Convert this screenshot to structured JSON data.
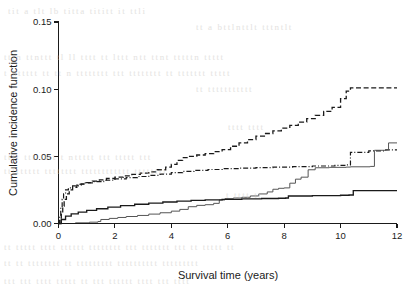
{
  "figure": {
    "background_color": "#ffffff",
    "ink_color": "#1a1a1a"
  },
  "bleed_through_text": [
    {
      "text": "tit  a  tlt lb  titta  tititt  it  ttli",
      "x": 8,
      "y": 6,
      "size": 9,
      "opacity": 0.5
    },
    {
      "text": "tt a bttlnttlt  tttntlt",
      "x": 196,
      "y": 22,
      "size": 9,
      "opacity": 0.5
    },
    {
      "text": "tttn ttnttt  tl ll tttt  tt lttt  ntt  ttnt tttttn ttttt",
      "x": 4,
      "y": 52,
      "size": 9,
      "opacity": 0.5
    },
    {
      "text": "t  nttttt  tt  tt n tttttttt   ttt  tttttttt  tt  ttttttt  ttttt",
      "x": 4,
      "y": 68,
      "size": 9,
      "opacity": 0.5
    },
    {
      "text": "tt ttttttttttt",
      "x": 196,
      "y": 84,
      "size": 9,
      "opacity": 0.5
    },
    {
      "text": "tttt tttt",
      "x": 228,
      "y": 122,
      "size": 9,
      "opacity": 0.5
    },
    {
      "text": "tttt ttt tttt   t  nttttt   ttt  ttttt  ttt",
      "x": 4,
      "y": 152,
      "size": 9,
      "opacity": 0.5
    },
    {
      "text": "ttttttttt  tttttttt  tttttttttttt tttttttt",
      "x": 4,
      "y": 166,
      "size": 9,
      "opacity": 0.5
    },
    {
      "text": "t  tttt  tt",
      "x": 226,
      "y": 190,
      "size": 9,
      "opacity": 0.5
    },
    {
      "text": "tt ttttt  tttt  tttttt tttttttt   ttt   ttttttt   ttt  tt ttttt  tt",
      "x": 4,
      "y": 242,
      "size": 9,
      "opacity": 0.5
    },
    {
      "text": "tt  tt  tttttttt tt  ttttttttt  tttttttttt  ttttttttt",
      "x": 4,
      "y": 258,
      "size": 9,
      "opacity": 0.5
    },
    {
      "text": "ttt  ttt tttt  ttttt  tt  ttt  tttttt  tttt  ttt  tttt",
      "x": 4,
      "y": 276,
      "size": 9,
      "opacity": 0.5
    }
  ],
  "chart_data": {
    "type": "line",
    "title": "",
    "xlabel": "Survival time (years)",
    "ylabel": "Cumulative incidence function",
    "xlim": [
      0,
      12
    ],
    "ylim": [
      0,
      0.15
    ],
    "xticks": [
      0,
      2,
      4,
      6,
      8,
      10,
      12
    ],
    "xticklabels": [
      "0",
      "2",
      "4",
      "6",
      "8",
      "10",
      "12"
    ],
    "yticks": [
      0.0,
      0.05,
      0.1,
      0.15
    ],
    "yticklabels": [
      "0.00",
      "0.05",
      "0.10",
      "0.15"
    ],
    "grid": false,
    "legend": "none",
    "series": [
      {
        "name": "curve-dashed-upper",
        "style": "dashed",
        "final_value": 0.101,
        "points": [
          [
            0.0,
            0.0
          ],
          [
            0.05,
            0.003
          ],
          [
            0.1,
            0.008
          ],
          [
            0.15,
            0.013
          ],
          [
            0.2,
            0.018
          ],
          [
            0.28,
            0.022
          ],
          [
            0.38,
            0.025
          ],
          [
            0.5,
            0.027
          ],
          [
            0.65,
            0.0285
          ],
          [
            0.8,
            0.0295
          ],
          [
            1.0,
            0.0305
          ],
          [
            1.2,
            0.0315
          ],
          [
            1.45,
            0.0325
          ],
          [
            1.7,
            0.0335
          ],
          [
            2.0,
            0.0345
          ],
          [
            2.3,
            0.0355
          ],
          [
            2.6,
            0.0365
          ],
          [
            2.9,
            0.0375
          ],
          [
            3.2,
            0.0385
          ],
          [
            3.5,
            0.04
          ],
          [
            3.8,
            0.042
          ],
          [
            4.0,
            0.044
          ],
          [
            4.2,
            0.047
          ],
          [
            4.4,
            0.049
          ],
          [
            4.6,
            0.05
          ],
          [
            4.9,
            0.051
          ],
          [
            5.2,
            0.052
          ],
          [
            5.5,
            0.0535
          ],
          [
            5.8,
            0.055
          ],
          [
            6.1,
            0.0575
          ],
          [
            6.4,
            0.06
          ],
          [
            6.7,
            0.0625
          ],
          [
            7.0,
            0.065
          ],
          [
            7.3,
            0.067
          ],
          [
            7.6,
            0.069
          ],
          [
            7.9,
            0.071
          ],
          [
            8.2,
            0.073
          ],
          [
            8.5,
            0.0755
          ],
          [
            8.8,
            0.078
          ],
          [
            9.1,
            0.0805
          ],
          [
            9.4,
            0.0835
          ],
          [
            9.7,
            0.0865
          ],
          [
            10.0,
            0.093
          ],
          [
            10.2,
            0.0985
          ],
          [
            10.35,
            0.101
          ],
          [
            12.0,
            0.101
          ]
        ]
      },
      {
        "name": "curve-dashdot-second",
        "style": "dashdot",
        "final_value": 0.055,
        "points": [
          [
            0.0,
            0.0
          ],
          [
            0.04,
            0.006
          ],
          [
            0.08,
            0.012
          ],
          [
            0.13,
            0.018
          ],
          [
            0.18,
            0.022
          ],
          [
            0.25,
            0.025
          ],
          [
            0.35,
            0.0265
          ],
          [
            0.5,
            0.028
          ],
          [
            0.7,
            0.0292
          ],
          [
            0.95,
            0.0302
          ],
          [
            1.25,
            0.0312
          ],
          [
            1.6,
            0.0322
          ],
          [
            2.0,
            0.0332
          ],
          [
            2.4,
            0.0342
          ],
          [
            2.8,
            0.035
          ],
          [
            3.2,
            0.0358
          ],
          [
            3.6,
            0.0368
          ],
          [
            4.0,
            0.0378
          ],
          [
            4.4,
            0.0388
          ],
          [
            4.8,
            0.0396
          ],
          [
            5.3,
            0.0402
          ],
          [
            5.8,
            0.0408
          ],
          [
            6.4,
            0.0412
          ],
          [
            7.0,
            0.0416
          ],
          [
            7.6,
            0.042
          ],
          [
            8.3,
            0.0424
          ],
          [
            9.0,
            0.0428
          ],
          [
            9.8,
            0.0432
          ],
          [
            10.2,
            0.0436
          ],
          [
            10.35,
            0.053
          ],
          [
            11.0,
            0.054
          ],
          [
            11.6,
            0.0548
          ],
          [
            12.0,
            0.0548
          ]
        ]
      },
      {
        "name": "curve-solid-thin-third",
        "style": "solid-thin",
        "final_value": 0.06,
        "points": [
          [
            0.0,
            0.0
          ],
          [
            0.6,
            0.0005
          ],
          [
            1.1,
            0.001
          ],
          [
            1.4,
            0.0015
          ],
          [
            1.5,
            0.003
          ],
          [
            1.8,
            0.0038
          ],
          [
            2.1,
            0.0045
          ],
          [
            2.4,
            0.0052
          ],
          [
            2.8,
            0.006
          ],
          [
            3.2,
            0.007
          ],
          [
            3.6,
            0.008
          ],
          [
            4.0,
            0.0092
          ],
          [
            4.3,
            0.0105
          ],
          [
            4.6,
            0.0125
          ],
          [
            4.9,
            0.0135
          ],
          [
            5.2,
            0.014
          ],
          [
            5.5,
            0.015
          ],
          [
            5.7,
            0.0175
          ],
          [
            5.9,
            0.0185
          ],
          [
            6.2,
            0.019
          ],
          [
            6.5,
            0.0195
          ],
          [
            6.8,
            0.0205
          ],
          [
            7.1,
            0.022
          ],
          [
            7.4,
            0.0235
          ],
          [
            7.6,
            0.0255
          ],
          [
            7.8,
            0.0262
          ],
          [
            8.0,
            0.0265
          ],
          [
            8.2,
            0.03
          ],
          [
            8.4,
            0.033
          ],
          [
            8.6,
            0.0345
          ],
          [
            8.85,
            0.04
          ],
          [
            9.1,
            0.0415
          ],
          [
            9.6,
            0.0418
          ],
          [
            10.2,
            0.042
          ],
          [
            10.35,
            0.0422
          ],
          [
            11.05,
            0.0425
          ],
          [
            11.2,
            0.0545
          ],
          [
            11.6,
            0.0548
          ],
          [
            11.7,
            0.06
          ],
          [
            12.0,
            0.06
          ]
        ]
      },
      {
        "name": "curve-solid-thick-lowest",
        "style": "solid-thick",
        "final_value": 0.0245,
        "points": [
          [
            0.0,
            0.0
          ],
          [
            0.1,
            0.003
          ],
          [
            0.25,
            0.0055
          ],
          [
            0.45,
            0.0072
          ],
          [
            0.7,
            0.0085
          ],
          [
            1.0,
            0.0098
          ],
          [
            1.35,
            0.011
          ],
          [
            1.75,
            0.0122
          ],
          [
            2.2,
            0.0133
          ],
          [
            2.7,
            0.0143
          ],
          [
            3.2,
            0.0152
          ],
          [
            3.7,
            0.016
          ],
          [
            4.2,
            0.0167
          ],
          [
            4.7,
            0.0172
          ],
          [
            5.2,
            0.0176
          ],
          [
            5.8,
            0.018
          ],
          [
            6.5,
            0.0183
          ],
          [
            7.2,
            0.0186
          ],
          [
            7.8,
            0.0188
          ],
          [
            8.05,
            0.019
          ],
          [
            8.15,
            0.0205
          ],
          [
            9.0,
            0.0208
          ],
          [
            10.0,
            0.021
          ],
          [
            10.3,
            0.0212
          ],
          [
            10.45,
            0.0245
          ],
          [
            12.0,
            0.0245
          ]
        ]
      }
    ]
  }
}
